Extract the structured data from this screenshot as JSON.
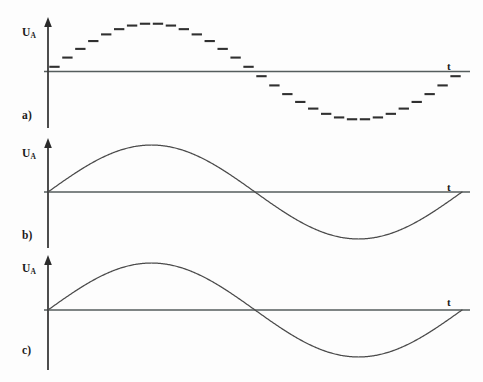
{
  "figure": {
    "background_color": "#fdfdfd",
    "ink_color": "#3a3a3a",
    "width": 483,
    "height": 382
  },
  "panels": [
    {
      "key": "a",
      "index_label": "a)",
      "y_axis_label_main": "U",
      "y_axis_label_sub": "A",
      "x_axis_label": "t",
      "waveform": "stepped-sine"
    },
    {
      "key": "b",
      "index_label": "b)",
      "y_axis_label_main": "U",
      "y_axis_label_sub": "A",
      "x_axis_label": "t",
      "waveform": "smooth-sine"
    },
    {
      "key": "c",
      "index_label": "c)",
      "y_axis_label_main": "U",
      "y_axis_label_sub": "A",
      "x_axis_label": "t",
      "waveform": "smooth-sine"
    }
  ],
  "chart_data": {
    "type": "line",
    "title": "",
    "xlabel": "t",
    "ylabel": "U_A",
    "grid": false,
    "legend": "none",
    "xlim": [
      0,
      1
    ],
    "ylim": [
      -1,
      1
    ],
    "panels": [
      {
        "label": "a)",
        "series_name": "quantized sine (staircase)",
        "style": "stepped horizontal dashes, no vertical risers",
        "period_fraction_of_axis": 1.0,
        "amplitude_normalized": 1.0,
        "step_count": 32,
        "x": [
          0.015625,
          0.046875,
          0.078125,
          0.109375,
          0.140625,
          0.171875,
          0.203125,
          0.234375,
          0.265625,
          0.296875,
          0.328125,
          0.359375,
          0.390625,
          0.421875,
          0.453125,
          0.484375,
          0.515625,
          0.546875,
          0.578125,
          0.609375,
          0.640625,
          0.671875,
          0.703125,
          0.734375,
          0.765625,
          0.796875,
          0.828125,
          0.859375,
          0.890625,
          0.921875,
          0.953125,
          0.984375
        ],
        "y": [
          0.098,
          0.29,
          0.471,
          0.634,
          0.773,
          0.882,
          0.957,
          0.995,
          0.995,
          0.957,
          0.882,
          0.773,
          0.634,
          0.471,
          0.29,
          0.098,
          -0.098,
          -0.29,
          -0.471,
          -0.634,
          -0.773,
          -0.882,
          -0.957,
          -0.995,
          -0.995,
          -0.957,
          -0.882,
          -0.773,
          -0.634,
          -0.471,
          -0.29,
          -0.098
        ]
      },
      {
        "label": "b)",
        "series_name": "smoothed sine",
        "style": "continuous curve",
        "period_fraction_of_axis": 1.0,
        "amplitude_normalized": 1.0,
        "x": [
          0,
          0.125,
          0.25,
          0.375,
          0.5,
          0.625,
          0.75,
          0.875,
          1.0
        ],
        "y": [
          0,
          0.707,
          1.0,
          0.707,
          0,
          -0.707,
          -1.0,
          -0.707,
          0
        ]
      },
      {
        "label": "c)",
        "series_name": "smoothed sine",
        "style": "continuous curve",
        "period_fraction_of_axis": 1.0,
        "amplitude_normalized": 1.0,
        "x": [
          0,
          0.125,
          0.25,
          0.375,
          0.5,
          0.625,
          0.75,
          0.875,
          1.0
        ],
        "y": [
          0,
          0.707,
          1.0,
          0.707,
          0,
          -0.707,
          -1.0,
          -0.707,
          0
        ]
      }
    ]
  }
}
